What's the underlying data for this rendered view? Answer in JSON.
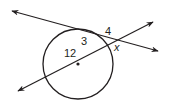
{
  "diagram": {
    "type": "circle-secant-segments",
    "circle": {
      "center": [
        78,
        64
      ],
      "radius": 35,
      "center_marked": true
    },
    "lines": [
      {
        "id": "secant-upper",
        "from": [
          12,
          11
        ],
        "to": [
          158,
          51
        ],
        "arrows": "both"
      },
      {
        "id": "secant-through-center",
        "from": [
          18,
          91
        ],
        "to": [
          153,
          22
        ],
        "arrows": "both"
      }
    ],
    "labels": {
      "external_segment_upper": "4",
      "internal_segment_upper": "3",
      "internal_segment_center": "12",
      "external_segment_unknown": "x"
    },
    "colors": {
      "stroke": "#231f20",
      "background": "#ffffff"
    }
  }
}
